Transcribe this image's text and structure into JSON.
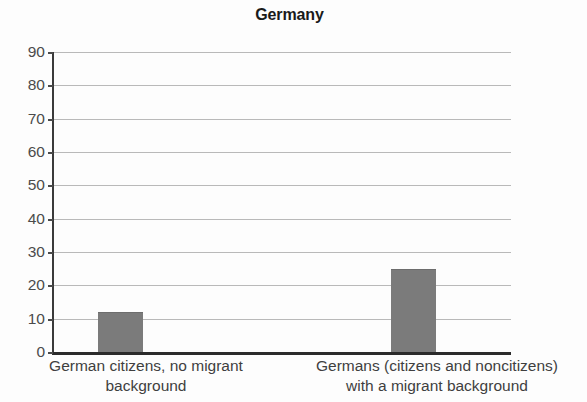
{
  "chart_data": {
    "type": "bar",
    "title": "Germany",
    "xlabel": "",
    "ylabel": "",
    "categories": [
      "German citizens, no migrant background",
      "Germans (citizens and noncitizens) with a migrant background"
    ],
    "category_lines": [
      [
        "German citizens, no migrant",
        "background"
      ],
      [
        "Germans (citizens and noncitizens)",
        "with a migrant background"
      ]
    ],
    "values": [
      12,
      25
    ],
    "ylim": [
      0,
      90
    ],
    "yticks": [
      0,
      10,
      20,
      30,
      40,
      50,
      60,
      70,
      80,
      90
    ],
    "ytick_labels": [
      "0",
      "10",
      "20",
      "30",
      "40",
      "50",
      "60",
      "70",
      "80",
      "90"
    ],
    "grid": true,
    "legend": false,
    "bar_color": "#7b7b7b",
    "axis_color": "#2b2b2b",
    "grid_color": "#b9b9b9",
    "background_color": "#fdfdfd"
  }
}
